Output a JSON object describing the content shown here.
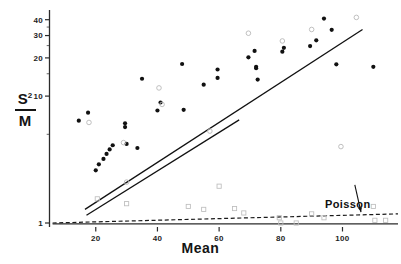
{
  "chart_data": {
    "type": "scatter",
    "title": "",
    "xlabel": "Mean",
    "ylabel": "S2/M",
    "ylabel_numerator": "S",
    "ylabel_numerator_sup": "2",
    "ylabel_denominator": "M",
    "y_scale": "log",
    "xlim": [
      5,
      118
    ],
    "ylim": [
      0.93,
      46
    ],
    "xticks": [
      20,
      40,
      60,
      80,
      100
    ],
    "yticks": [
      1,
      10,
      20,
      30,
      40
    ],
    "y_minor_ticks": [
      5,
      15,
      25,
      35
    ],
    "grid": false,
    "legend": false,
    "annotations": [
      {
        "text": "Poisson",
        "x": 104,
        "y": 2.0,
        "arrow_to_x": 106,
        "arrow_to_y": 1.22
      }
    ],
    "series": [
      {
        "name": "filled-circles",
        "marker": "filled-circle",
        "color": "#111111",
        "points": [
          [
            14.5,
            6.4
          ],
          [
            17.5,
            7.4
          ],
          [
            20.0,
            2.6
          ],
          [
            21.0,
            2.9
          ],
          [
            22.5,
            3.2
          ],
          [
            23.5,
            3.5
          ],
          [
            24.5,
            3.8
          ],
          [
            25.5,
            4.1
          ],
          [
            29.5,
            5.7
          ],
          [
            29.5,
            6.1
          ],
          [
            30.0,
            4.2
          ],
          [
            33.5,
            3.9
          ],
          [
            35.0,
            13.7
          ],
          [
            40.0,
            7.7
          ],
          [
            41.0,
            8.9
          ],
          [
            48.0,
            17.9
          ],
          [
            48.5,
            7.8
          ],
          [
            55.0,
            12.3
          ],
          [
            59.5,
            16.2
          ],
          [
            59.5,
            13.9
          ],
          [
            69.5,
            20.2
          ],
          [
            71.5,
            22.7
          ],
          [
            72.0,
            17.0
          ],
          [
            72.0,
            16.6
          ],
          [
            72.5,
            13.5
          ],
          [
            80.5,
            22.4
          ],
          [
            81.0,
            24.0
          ],
          [
            89.5,
            24.8
          ],
          [
            91.5,
            27.5
          ],
          [
            94.0,
            40.8
          ],
          [
            96.5,
            33.3
          ],
          [
            98.0,
            17.8
          ],
          [
            110.0,
            17.0
          ]
        ]
      },
      {
        "name": "open-circles",
        "marker": "open-circle",
        "color": "#b9b9b9",
        "points": [
          [
            17.8,
            6.2
          ],
          [
            29.0,
            4.3
          ],
          [
            30.0,
            2.1
          ],
          [
            40.5,
            11.6
          ],
          [
            41.5,
            8.6
          ],
          [
            57.0,
            5.3
          ],
          [
            69.5,
            31.3
          ],
          [
            80.5,
            27.2
          ],
          [
            90.0,
            33.5
          ],
          [
            104.5,
            41.7
          ],
          [
            99.5,
            4.0
          ]
        ]
      },
      {
        "name": "open-squares-poisson",
        "marker": "open-square",
        "color": "#bdbdbd",
        "points": [
          [
            20.5,
            1.55
          ],
          [
            30.0,
            1.42
          ],
          [
            50.0,
            1.35
          ],
          [
            55.0,
            1.28
          ],
          [
            60.0,
            1.95
          ],
          [
            65.0,
            1.3
          ],
          [
            68.0,
            1.2
          ],
          [
            79.5,
            1.1
          ],
          [
            80.0,
            1.0
          ],
          [
            85.0,
            1.0
          ],
          [
            90.0,
            1.18
          ],
          [
            94.0,
            1.1
          ],
          [
            110.0,
            1.35
          ],
          [
            110.5,
            1.05
          ],
          [
            114.0,
            1.05
          ]
        ]
      }
    ],
    "lines": [
      {
        "name": "upper-regression-line",
        "style": "solid",
        "from": [
          16.5,
          1.28
        ],
        "to": [
          106.5,
          33.5
        ]
      },
      {
        "name": "lower-regression-line",
        "style": "solid",
        "from": [
          17.0,
          1.15
        ],
        "to": [
          66.5,
          6.5
        ]
      },
      {
        "name": "poisson-reference-line",
        "style": "dashed",
        "from": [
          6.0,
          1.0
        ],
        "to": [
          118.0,
          1.18
        ]
      },
      {
        "name": "baseline-solid",
        "style": "solid",
        "from": [
          6.0,
          0.985
        ],
        "to": [
          118.0,
          0.985
        ]
      }
    ]
  },
  "axes": {
    "x_title": "Mean",
    "x_tick_labels": [
      "20",
      "40",
      "60",
      "80",
      "100"
    ],
    "y_tick_labels": [
      "1",
      "10",
      "20",
      "30",
      "40"
    ]
  },
  "labels": {
    "poisson": "Poisson"
  }
}
